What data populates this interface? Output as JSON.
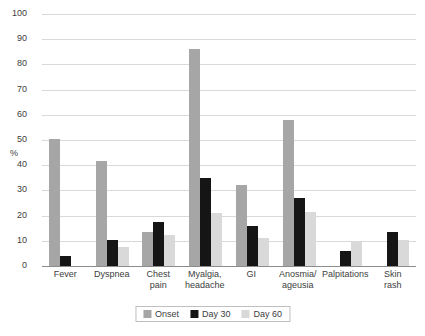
{
  "chart_data": {
    "type": "bar",
    "title": "",
    "xlabel": "",
    "ylabel": "%",
    "ylim": [
      0,
      100
    ],
    "ytick_step": 10,
    "yticks": [
      100,
      90,
      80,
      70,
      60,
      50,
      40,
      30,
      20,
      10,
      0
    ],
    "grid": true,
    "legend_position": "bottom-center",
    "categories": [
      "Fever",
      "Dyspnea",
      "Chest pain",
      "Myalgia, headache",
      "GI",
      "Anosmia/ ageusia",
      "Palpitations",
      "Skin rash"
    ],
    "category_lines": [
      [
        "Fever"
      ],
      [
        "Dyspnea"
      ],
      [
        "Chest",
        "pain"
      ],
      [
        "Myalgia,",
        "headache"
      ],
      [
        "GI"
      ],
      [
        "Anosmia/",
        "ageusia"
      ],
      [
        "Palpitations"
      ],
      [
        "Skin",
        "rash"
      ]
    ],
    "series": [
      {
        "name": "Onset",
        "color": "#a6a6a6",
        "values": [
          50.5,
          41.5,
          13.5,
          86,
          32,
          58,
          null,
          null
        ]
      },
      {
        "name": "Day 30",
        "color": "#151515",
        "values": [
          4,
          10.5,
          17.5,
          35,
          16,
          27,
          6,
          13.5
        ]
      },
      {
        "name": "Day 60",
        "color": "#d9d9d9",
        "values": [
          null,
          7.5,
          12.5,
          21,
          11,
          21.5,
          9.5,
          10.5
        ]
      }
    ]
  },
  "legend": {
    "items": [
      {
        "label": "Onset"
      },
      {
        "label": "Day 30"
      },
      {
        "label": "Day 60"
      }
    ]
  }
}
